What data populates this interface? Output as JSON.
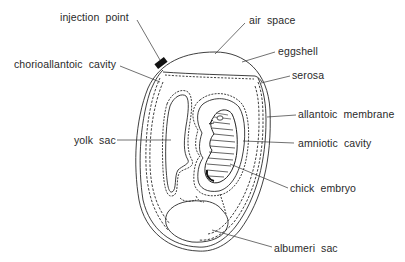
{
  "diagram": {
    "colors": {
      "line": "#2a2a2a",
      "background": "#ffffff",
      "injection_marker": "#111111"
    },
    "labels": {
      "injection_point": "injection point",
      "chorioallantoic_cavity": "chorioallantoic cavity",
      "air_space": "air space",
      "eggshell": "eggshell",
      "serosa": "serosa",
      "allantoic_membrane": "allantoic membrane",
      "yolk_sac": "yolk sac",
      "amniotic_cavity": "amniotic cavity",
      "chick_embryo": "chick embryo",
      "albumen_sac": "albumeri sac"
    }
  }
}
